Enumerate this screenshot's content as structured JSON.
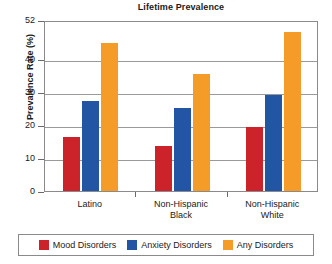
{
  "chart_data": {
    "type": "bar",
    "title": "Lifetime Prevalence",
    "xlabel": "",
    "ylabel": "Prevalence Rate (%)",
    "ylim": [
      0,
      52
    ],
    "yticks": [
      0,
      10,
      20,
      30,
      40,
      52
    ],
    "grid": true,
    "legend_position": "bottom",
    "categories": [
      "Latino",
      "Non-Hispanic Black",
      "Non-Hispanic White"
    ],
    "series": [
      {
        "name": "Mood Disorders",
        "color": "#cc2229",
        "values": [
          16.4,
          13.7,
          19.5
        ]
      },
      {
        "name": "Anxiety Disorders",
        "color": "#2255a4",
        "values": [
          27.3,
          25.1,
          29.1
        ]
      },
      {
        "name": "Any Disorders",
        "color": "#f59b28",
        "values": [
          45.0,
          35.6,
          48.5
        ]
      }
    ]
  },
  "axis": {
    "y_title": "Prevalence Rate (%)",
    "y_tick_labels": [
      "52",
      "40",
      "30",
      "20",
      "10",
      "0"
    ],
    "x_tick_labels": [
      {
        "line1": "Latino",
        "line2": ""
      },
      {
        "line1": "Non-Hispanic",
        "line2": "Black"
      },
      {
        "line1": "Non-Hispanic",
        "line2": "White"
      }
    ]
  },
  "legend": {
    "items": [
      {
        "label": "Mood Disorders",
        "color": "#cc2229"
      },
      {
        "label": "Anxiety Disorders",
        "color": "#2255a4"
      },
      {
        "label": "Any Disorders",
        "color": "#f59b28"
      }
    ]
  }
}
